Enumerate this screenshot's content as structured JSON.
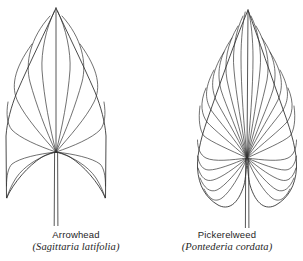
{
  "figure": {
    "background_color": "#ffffff",
    "ink_color": "#2b2b2b",
    "width": 303,
    "height": 261
  },
  "specimens": [
    {
      "id": "arrowhead",
      "common_name": "Arrowhead",
      "scientific_name": "(Sagittaria latifolia)",
      "leaf_shape": "sagittate",
      "description": "Arrow-shaped leaf with two long, narrow, downward-pointing basal lobes and a pointed apex",
      "vein_pattern": "palmate, veins radiating from a single basal convergence point",
      "vein_count": 11,
      "apex": {
        "x": 56,
        "y": 8
      },
      "convergence_point": {
        "x": 56,
        "y": 152
      },
      "petiole_end": {
        "x": 56,
        "y": 226
      },
      "extent": {
        "left": 5,
        "right": 107,
        "top": 8,
        "bottom": 200
      }
    },
    {
      "id": "pickerelweed",
      "common_name": "Pickerelweed",
      "scientific_name": "(Pontederia cordata)",
      "leaf_shape": "cordate",
      "description": "Heart-shaped leaf with rounded basal lobes and a long tapering pointed apex",
      "vein_pattern": "palmate, many closely spaced arcing veins converging at the base",
      "vein_count": 19,
      "apex": {
        "x": 248,
        "y": 10
      },
      "convergence_point": {
        "x": 247,
        "y": 158
      },
      "petiole_end": {
        "x": 247,
        "y": 228
      },
      "extent": {
        "left": 196,
        "right": 297,
        "top": 10,
        "bottom": 208
      }
    }
  ]
}
